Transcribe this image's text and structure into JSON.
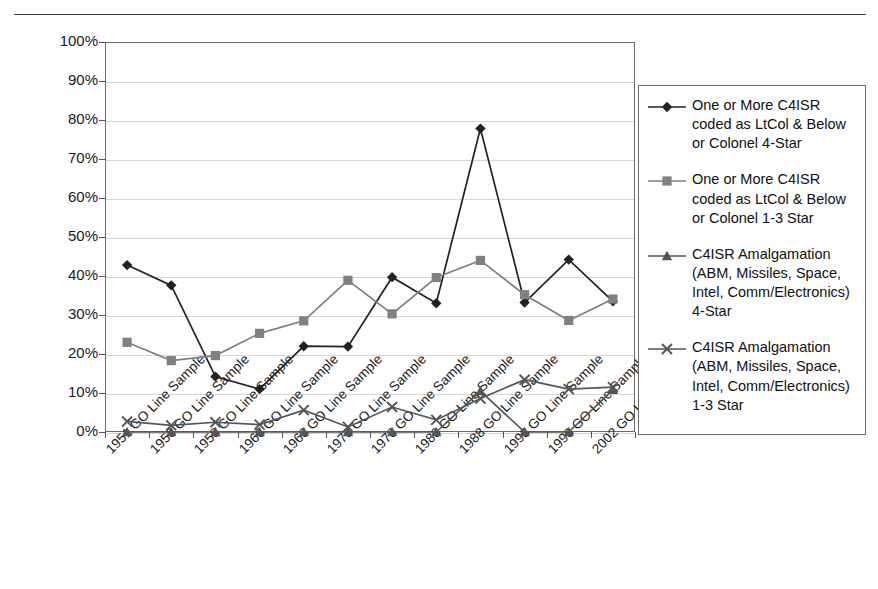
{
  "page": {
    "top_rule": "horizontal-rule"
  },
  "chart_data": {
    "type": "line",
    "title": "",
    "subtitle": "",
    "xlabel": "",
    "ylabel": "",
    "ylim": [
      0,
      100
    ],
    "y_tick_labels": [
      "0%",
      "10%",
      "20%",
      "30%",
      "40%",
      "50%",
      "60%",
      "70%",
      "80%",
      "90%",
      "100%"
    ],
    "y_tick_values": [
      0,
      10,
      20,
      30,
      40,
      50,
      60,
      70,
      80,
      90,
      100
    ],
    "grid": true,
    "legend_position": "right",
    "categories": [
      "1951 GO Line Sample",
      "1953 GO Line Sample",
      "1958 GO Line Sample",
      "1963 GO Line Sample",
      "1968 GO Line Sample",
      "1973 GO Line Sample",
      "1978 GO Line Sample",
      "1983 GO Line Sample",
      "1988 GO Line Sample",
      "1993 GO Line Sample",
      "1998 GO Line Sample",
      "2002 GO Line Sample"
    ],
    "series": [
      {
        "name": "One or More C4ISR coded as LtCol & Below or Colonel 4-Star",
        "marker": "diamond",
        "color": "#222222",
        "values": [
          42.8,
          37.6,
          14.2,
          11.0,
          22.0,
          21.9,
          39.7,
          33.0,
          77.8,
          33.2,
          44.2,
          33.5
        ]
      },
      {
        "name": "One or More C4ISR coded as LtCol & Below or Colonel 1-3 Star",
        "marker": "square",
        "color": "#808080",
        "values": [
          23.0,
          18.3,
          19.6,
          25.3,
          28.5,
          38.9,
          30.3,
          39.6,
          44.0,
          35.2,
          28.6,
          34.1
        ]
      },
      {
        "name": "C4ISR Amalgamation (ABM, Missiles, Space, Intel, Comm/Electronics) 4-Star",
        "marker": "triangle",
        "color": "#555555",
        "values": [
          0.0,
          0.0,
          0.0,
          0.0,
          0.0,
          0.0,
          0.0,
          0.0,
          10.5,
          0.0,
          0.0,
          10.8
        ]
      },
      {
        "name": "C4ISR Amalgamation (ABM, Missiles, Space, Intel, Comm/Electronics) 1-3 Star",
        "marker": "cross",
        "color": "#555555",
        "values": [
          2.7,
          1.7,
          2.5,
          1.9,
          5.6,
          1.3,
          6.4,
          3.1,
          8.6,
          13.4,
          11.0,
          11.5
        ]
      }
    ]
  },
  "legend": {
    "entries": [
      {
        "marker": "diamond",
        "label": "One or More C4ISR\ncoded as LtCol & Below\nor Colonel 4-Star"
      },
      {
        "marker": "square",
        "label": "One or More C4ISR\ncoded as LtCol & Below\nor Colonel 1-3 Star"
      },
      {
        "marker": "triangle",
        "label": "C4ISR Amalgamation\n(ABM, Missiles, Space,\nIntel, Comm/Electronics)\n4-Star"
      },
      {
        "marker": "cross",
        "label": "C4ISR Amalgamation\n(ABM, Missiles, Space,\nIntel, Comm/Electronics)\n1-3 Star"
      }
    ]
  },
  "colors": {
    "series_1": "#222222",
    "series_2": "#808080",
    "series_3": "#555555",
    "series_4": "#555555",
    "axis": "#6b6b6b",
    "grid": "#d5d5d5",
    "text": "#1a1a1a"
  }
}
